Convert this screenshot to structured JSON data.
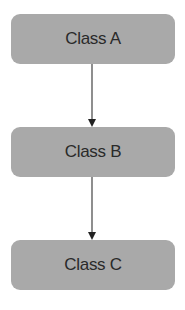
{
  "diagram": {
    "type": "hierarchy",
    "nodes": [
      {
        "id": "a",
        "label": "Class A"
      },
      {
        "id": "b",
        "label": "Class B"
      },
      {
        "id": "c",
        "label": "Class C"
      }
    ],
    "edges": [
      {
        "from": "a",
        "to": "b"
      },
      {
        "from": "b",
        "to": "c"
      }
    ],
    "colors": {
      "node_fill": "#a9a9a9",
      "node_text": "#2a2a2a",
      "edge": "#333333",
      "background": "#ffffff"
    }
  }
}
